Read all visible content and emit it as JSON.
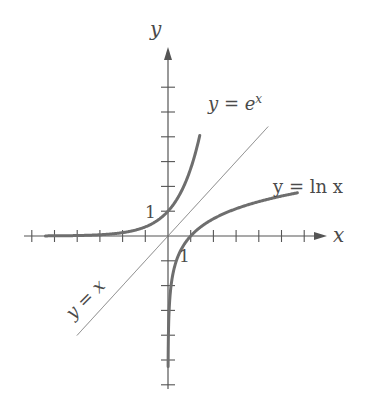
{
  "chart_data": {
    "type": "line",
    "title": "",
    "xlabel": "x",
    "ylabel": "y",
    "xlim": [
      -6.2,
      7
    ],
    "ylim": [
      -6.1,
      7.6
    ],
    "grid": false,
    "x_ticks": [
      -6,
      -5,
      -4,
      -3,
      -2,
      -1,
      1,
      2,
      3,
      4,
      5,
      6
    ],
    "y_ticks": [
      -6,
      -5,
      -4,
      -3,
      -2,
      -1,
      1,
      2,
      3,
      4,
      5,
      6
    ],
    "tick_labels": [
      {
        "axis": "y",
        "value": 1,
        "text": "1"
      },
      {
        "axis": "x",
        "value": 1,
        "text": "1"
      }
    ],
    "series": [
      {
        "name": "exp",
        "label": "y = e",
        "label_sup": "x",
        "function": "e^x",
        "x_range": [
          -5.4,
          1.4
        ],
        "style": "thick"
      },
      {
        "name": "ln",
        "label": "y = ln x",
        "function": "ln(x)",
        "x_range": [
          0.0052,
          5.7
        ],
        "style": "thick"
      },
      {
        "name": "identity",
        "label": "y = x",
        "function": "x",
        "x_range": [
          -4,
          4.4
        ],
        "style": "thin"
      }
    ]
  },
  "colors": {
    "curve": "#6e6e6e",
    "axis": "#555555",
    "text": "#4a4a4a"
  }
}
